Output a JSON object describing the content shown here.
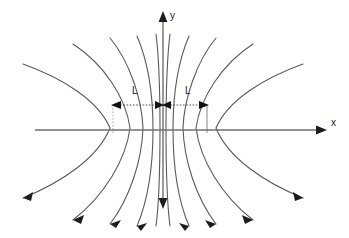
{
  "figure": {
    "width": 349,
    "height": 238,
    "background_color": "#ffffff"
  },
  "axes": {
    "x_axis": {
      "label": "x",
      "label_x": 331,
      "label_y": 118,
      "y": 130,
      "x_start": 35,
      "x_end": 325,
      "arrow_at": "end",
      "color": "#6f6f6f"
    },
    "y_axis": {
      "label": "y",
      "label_x": 170,
      "label_y": 11,
      "x": 163,
      "y_start": 12,
      "y_end": 207,
      "arrow_at": "both",
      "color": "#6f6f6f"
    }
  },
  "origin": {
    "x": 163,
    "y": 130
  },
  "dimensions": {
    "line_y": 105,
    "left_label": "L",
    "right_label": "L",
    "left_label_x": 132,
    "left_label_y": 86,
    "right_label_x": 185,
    "right_label_y": 86,
    "left_extent_x": 113,
    "center_x": 163,
    "right_extent_x": 207,
    "color": "#3a3a3a",
    "style": "dashed-double-arrow"
  },
  "guides": [
    {
      "name": "left-guide",
      "x": 113,
      "y_top": 105,
      "y_bottom": 133,
      "style": "dotted",
      "color": "#9a9a9a"
    },
    {
      "name": "right-guide",
      "x": 207,
      "y_top": 105,
      "y_bottom": 133,
      "style": "solid",
      "color": "#7a7a7a"
    }
  ],
  "field_lines": {
    "color": "#5a5a5a",
    "stroke_width": 1.1,
    "arrowhead_color": "#1c1c1c",
    "arrowheads_at": "lower-ends",
    "symmetry": "mirror about y-axis",
    "description": "Nested parabola-like curves opening away from the y-axis, vertices on the x-axis, upper ends open and lower ends terminating in arrowheads.",
    "left_group_vertex_x": [
      113,
      132,
      143,
      152,
      159
    ],
    "right_group_vertex_x": [
      213,
      194,
      183,
      174,
      167
    ],
    "count_per_side": 5
  },
  "colors": {
    "background": "#ffffff",
    "axis": "#6f6f6f",
    "field_line": "#5a5a5a",
    "arrowhead": "#1c1c1c",
    "dimension": "#3a3a3a",
    "guide_dotted": "#9a9a9a",
    "text": "#1c1c1c"
  }
}
